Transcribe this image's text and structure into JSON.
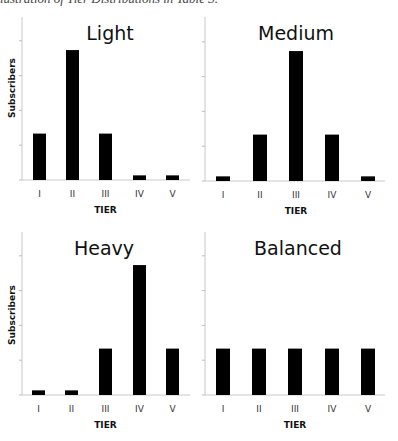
{
  "caption": "Illustration of Tier Distributions in Table 3.",
  "colors": {
    "bar": "#000000",
    "axis": "#c8c8c8",
    "tick": "#bdbdbd"
  },
  "chart_data": [
    {
      "type": "bar",
      "title": "Light",
      "categories": [
        "I",
        "II",
        "III",
        "IV",
        "V"
      ],
      "values": [
        20,
        56,
        20,
        2,
        2
      ],
      "xlabel": "TIER",
      "ylabel": "Subscribers",
      "ylim": [
        0,
        70
      ],
      "grid": false,
      "y_tick_labels_shown": false
    },
    {
      "type": "bar",
      "title": "Medium",
      "categories": [
        "I",
        "II",
        "III",
        "IV",
        "V"
      ],
      "values": [
        2,
        20,
        56,
        20,
        2
      ],
      "xlabel": "TIER",
      "ylabel": "",
      "ylim": [
        0,
        70
      ],
      "grid": false,
      "y_tick_labels_shown": false
    },
    {
      "type": "bar",
      "title": "Heavy",
      "categories": [
        "I",
        "II",
        "III",
        "IV",
        "V"
      ],
      "values": [
        2,
        2,
        20,
        56,
        20
      ],
      "xlabel": "TIER",
      "ylabel": "Subscribers",
      "ylim": [
        0,
        70
      ],
      "grid": false,
      "y_tick_labels_shown": false
    },
    {
      "type": "bar",
      "title": "Balanced",
      "categories": [
        "I",
        "II",
        "III",
        "IV",
        "V"
      ],
      "values": [
        20,
        20,
        20,
        20,
        20
      ],
      "xlabel": "TIER",
      "ylabel": "",
      "ylim": [
        0,
        70
      ],
      "grid": false,
      "y_tick_labels_shown": false
    }
  ],
  "layout": {
    "panels": [
      {
        "axis_x": 22,
        "axis_right": 190,
        "top": 17,
        "baseline": 180,
        "bar_x": [
          33,
          66,
          99,
          133,
          166
        ],
        "bar_w": 13,
        "title_x": 110,
        "title_y": 40,
        "label_y": 197,
        "xlabel_y": 213,
        "ylabel_x": 15,
        "ylabel_cy": 88
      },
      {
        "axis_x": 205,
        "axis_right": 385,
        "top": 17,
        "baseline": 181,
        "bar_x": [
          216,
          253,
          289,
          325,
          361
        ],
        "bar_w": 14,
        "title_x": 296,
        "title_y": 40,
        "label_y": 198,
        "xlabel_y": 214,
        "ylabel_x": null,
        "ylabel_cy": null
      },
      {
        "axis_x": 22,
        "axis_right": 190,
        "top": 232,
        "baseline": 395,
        "bar_x": [
          32,
          65,
          99,
          133,
          166
        ],
        "bar_w": 13,
        "title_x": 104,
        "title_y": 255,
        "label_y": 412,
        "xlabel_y": 428,
        "ylabel_x": 15,
        "ylabel_cy": 315
      },
      {
        "axis_x": 205,
        "axis_right": 385,
        "top": 232,
        "baseline": 395,
        "bar_x": [
          216,
          252,
          288,
          325,
          361
        ],
        "bar_w": 14,
        "title_x": 298,
        "title_y": 255,
        "label_y": 412,
        "xlabel_y": 428,
        "ylabel_x": null,
        "ylabel_cy": null
      }
    ],
    "px_per_unit": 2.32,
    "tick_step": 15
  }
}
